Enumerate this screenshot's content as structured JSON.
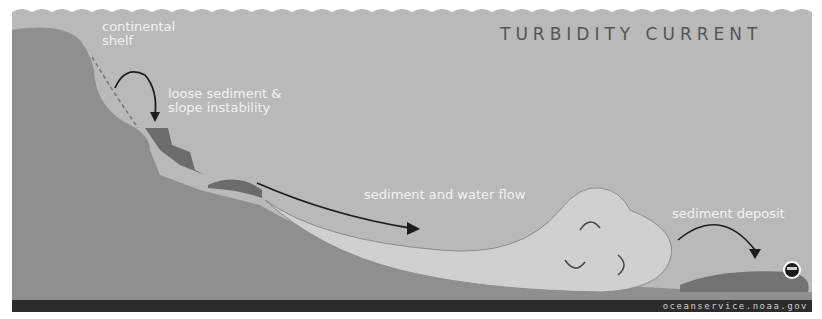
{
  "title": "TURBIDITY CURRENT",
  "labels": {
    "continental_shelf": [
      "continental",
      "shelf"
    ],
    "loose_sediment": [
      "loose sediment &",
      "slope instability"
    ],
    "flow": "sediment and water flow",
    "deposit": "sediment deposit"
  },
  "credit": "oceanservice.noaa.gov",
  "colors": {
    "water": "#b9b9b9",
    "land": "#8f8f8f",
    "slump": "#6c6c6c",
    "flow": "#d0d0d0",
    "seafloor_bar": "#2c2c2c",
    "deposit": "#737373"
  }
}
